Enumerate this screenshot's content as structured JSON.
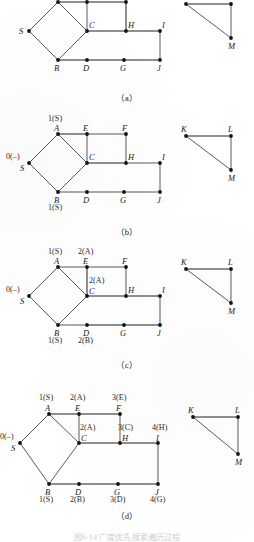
{
  "figure": {
    "bottom_caption": "图6-14  广度优先搜索遍历过程",
    "panels": [
      {
        "id": "a",
        "caption": "（a）",
        "main_vertices": [
          {
            "id": "A",
            "label": "A"
          },
          {
            "id": "E",
            "label": "E"
          },
          {
            "id": "F",
            "label": "F"
          },
          {
            "id": "S",
            "label": "S"
          },
          {
            "id": "C",
            "label": "C"
          },
          {
            "id": "H",
            "label": "H"
          },
          {
            "id": "I",
            "label": "I"
          },
          {
            "id": "B",
            "label": "B"
          },
          {
            "id": "D",
            "label": "D"
          },
          {
            "id": "G",
            "label": "G"
          },
          {
            "id": "J",
            "label": "J"
          }
        ],
        "side_vertices": [
          {
            "id": "K",
            "label": "K"
          },
          {
            "id": "L",
            "label": "L"
          },
          {
            "id": "M",
            "label": "M"
          }
        ],
        "distance_labels": []
      },
      {
        "id": "b",
        "caption": "（b）",
        "main_vertices": [
          {
            "id": "A",
            "label": "A"
          },
          {
            "id": "E",
            "label": "E"
          },
          {
            "id": "F",
            "label": "F"
          },
          {
            "id": "S",
            "label": "S"
          },
          {
            "id": "C",
            "label": "C"
          },
          {
            "id": "H",
            "label": "H"
          },
          {
            "id": "I",
            "label": "I"
          },
          {
            "id": "B",
            "label": "B"
          },
          {
            "id": "D",
            "label": "D"
          },
          {
            "id": "G",
            "label": "G"
          },
          {
            "id": "J",
            "label": "J"
          }
        ],
        "side_vertices": [
          {
            "id": "K",
            "label": "K"
          },
          {
            "id": "L",
            "label": "L"
          },
          {
            "id": "M",
            "label": "M"
          }
        ],
        "distance_labels": [
          {
            "for": "A",
            "dist": "1",
            "parent": "S",
            "text": "1(S)"
          },
          {
            "for": "S",
            "dist": "0",
            "parent": "–",
            "text": "0(–)"
          },
          {
            "for": "B",
            "dist": "1",
            "parent": "S",
            "text": "1(S)"
          }
        ]
      },
      {
        "id": "c",
        "caption": "（c）",
        "main_vertices": [
          {
            "id": "A",
            "label": "A"
          },
          {
            "id": "E",
            "label": "E"
          },
          {
            "id": "F",
            "label": "F"
          },
          {
            "id": "S",
            "label": "S"
          },
          {
            "id": "C",
            "label": "C"
          },
          {
            "id": "H",
            "label": "H"
          },
          {
            "id": "I",
            "label": "I"
          },
          {
            "id": "B",
            "label": "B"
          },
          {
            "id": "D",
            "label": "D"
          },
          {
            "id": "G",
            "label": "G"
          },
          {
            "id": "J",
            "label": "J"
          }
        ],
        "side_vertices": [
          {
            "id": "K",
            "label": "K"
          },
          {
            "id": "L",
            "label": "L"
          },
          {
            "id": "M",
            "label": "M"
          }
        ],
        "distance_labels": [
          {
            "for": "A",
            "dist": "1",
            "parent": "S",
            "text": "1(S)"
          },
          {
            "for": "E",
            "dist": "2",
            "parent": "A",
            "text": "2(A)"
          },
          {
            "for": "S",
            "dist": "0",
            "parent": "–",
            "text": "0(–)"
          },
          {
            "for": "C",
            "dist": "2",
            "parent": "A",
            "text": "2(A)"
          },
          {
            "for": "B",
            "dist": "1",
            "parent": "S",
            "text": "1(S)"
          },
          {
            "for": "D",
            "dist": "2",
            "parent": "B",
            "text": "2(B)"
          }
        ]
      },
      {
        "id": "d",
        "caption": "（d）",
        "main_vertices": [
          {
            "id": "A",
            "label": "A"
          },
          {
            "id": "E",
            "label": "E"
          },
          {
            "id": "F",
            "label": "F"
          },
          {
            "id": "S",
            "label": "S"
          },
          {
            "id": "C",
            "label": "C"
          },
          {
            "id": "H",
            "label": "H"
          },
          {
            "id": "I",
            "label": "I"
          },
          {
            "id": "B",
            "label": "B"
          },
          {
            "id": "D",
            "label": "D"
          },
          {
            "id": "G",
            "label": "G"
          },
          {
            "id": "J",
            "label": "J"
          }
        ],
        "side_vertices": [
          {
            "id": "K",
            "label": "K"
          },
          {
            "id": "L",
            "label": "L"
          },
          {
            "id": "M",
            "label": "M"
          }
        ],
        "distance_labels": [
          {
            "for": "A",
            "dist": "1",
            "parent": "S",
            "text": "1(S)"
          },
          {
            "for": "E",
            "dist": "2",
            "parent": "A",
            "text": "2(A)"
          },
          {
            "for": "F",
            "dist": "3",
            "parent": "E",
            "text": "3(E)"
          },
          {
            "for": "S",
            "dist": "0",
            "parent": "–",
            "text": "0(–)"
          },
          {
            "for": "C",
            "dist": "2",
            "parent": "A",
            "text": "2(A)"
          },
          {
            "for": "H",
            "dist": "3",
            "parent": "C",
            "text": "3(C)"
          },
          {
            "for": "I",
            "dist": "4",
            "parent": "H",
            "text": "4(H)"
          },
          {
            "for": "B",
            "dist": "1",
            "parent": "S",
            "text": "1(S)"
          },
          {
            "for": "D",
            "dist": "2",
            "parent": "B",
            "text": "2(B)"
          },
          {
            "for": "G",
            "dist": "3",
            "parent": "D",
            "text": "3(D)"
          },
          {
            "for": "J",
            "dist": "4",
            "parent": "G",
            "text": "4(G)"
          }
        ]
      }
    ],
    "graph": {
      "edges_main": [
        [
          "S",
          "A"
        ],
        [
          "S",
          "B"
        ],
        [
          "A",
          "C"
        ],
        [
          "B",
          "C"
        ],
        [
          "A",
          "E"
        ],
        [
          "E",
          "F"
        ],
        [
          "E",
          "C"
        ],
        [
          "F",
          "H"
        ],
        [
          "C",
          "H"
        ],
        [
          "H",
          "I"
        ],
        [
          "I",
          "J"
        ],
        [
          "B",
          "D"
        ],
        [
          "D",
          "G"
        ],
        [
          "G",
          "J"
        ]
      ],
      "edges_side": [
        [
          "K",
          "L"
        ],
        [
          "L",
          "M"
        ],
        [
          "K",
          "M"
        ]
      ]
    }
  }
}
